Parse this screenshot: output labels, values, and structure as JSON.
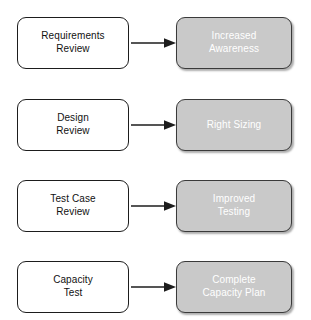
{
  "diagram": {
    "type": "flow-pairs",
    "background_color": "#ffffff",
    "source_box_color": "#ffffff",
    "source_text_color": "#111111",
    "target_box_color": "#c9c9c9",
    "target_text_color": "#ffffff",
    "arrow_color": "#1d1d1d",
    "rows": [
      {
        "source": "Requirements\nReview",
        "target": "Increased\nAwareness",
        "arrow": "right-arrow"
      },
      {
        "source": "Design\nReview",
        "target": "Right Sizing",
        "arrow": "right-arrow"
      },
      {
        "source": "Test Case\nReview",
        "target": "Improved\nTesting",
        "arrow": "right-arrow"
      },
      {
        "source": "Capacity\nTest",
        "target": "Complete\nCapacity Plan",
        "arrow": "right-arrow"
      }
    ]
  }
}
